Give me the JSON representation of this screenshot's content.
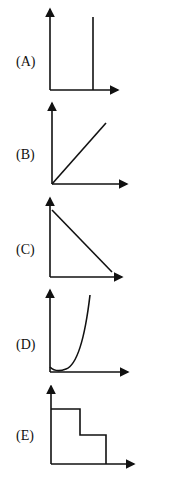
{
  "options": [
    {
      "id": "A",
      "label": "(A)",
      "shape": "vertical line"
    },
    {
      "id": "B",
      "label": "(B)",
      "shape": "increasing straight line through origin"
    },
    {
      "id": "C",
      "label": "(C)",
      "shape": "decreasing straight line"
    },
    {
      "id": "D",
      "label": "(D)",
      "shape": "upward parabolic curve"
    },
    {
      "id": "E",
      "label": "(E)",
      "shape": "descending step function"
    }
  ],
  "colors": {
    "ink": "#111111",
    "background": "#ffffff"
  }
}
